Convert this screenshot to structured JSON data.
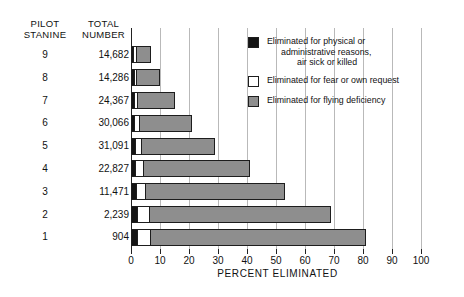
{
  "headers": {
    "stanine": "PILOT\nSTANINE",
    "number": "TOTAL\nNUMBER"
  },
  "axis": {
    "title": "PERCENT ELIMINATED",
    "ticks": [
      0,
      10,
      20,
      30,
      40,
      50,
      60,
      70,
      80,
      90,
      100
    ],
    "tick_labels": [
      "0",
      "10",
      "20",
      "30",
      "40",
      "50",
      "60",
      "70",
      "80",
      "90",
      "100"
    ],
    "min": 0,
    "max": 101
  },
  "legend": [
    {
      "swatch": "black",
      "label": "Eliminated for physical or\nadministrative reasons,\nair sick or killed"
    },
    {
      "swatch": "white",
      "label": "Eliminated for fear or own request"
    },
    {
      "swatch": "gray",
      "label": "Eliminated for flying deficiency"
    }
  ],
  "colors": {
    "black": "#141414",
    "white": "#ffffff",
    "gray": "#8e8e8e",
    "gridline": "#b9b9b9",
    "axis": "#222222"
  },
  "rows": [
    {
      "stanine": "9",
      "number": "14,682",
      "black": 0.6,
      "white": 0.5,
      "gray": 5.9,
      "total": 7.0
    },
    {
      "stanine": "8",
      "number": "14,286",
      "black": 0.7,
      "white": 0.6,
      "gray": 8.7,
      "total": 10.0
    },
    {
      "stanine": "7",
      "number": "24,367",
      "black": 0.8,
      "white": 0.9,
      "gray": 13.3,
      "total": 15.0
    },
    {
      "stanine": "6",
      "number": "30,066",
      "black": 0.9,
      "white": 1.3,
      "gray": 18.8,
      "total": 21.0
    },
    {
      "stanine": "5",
      "number": "31,091",
      "black": 1.0,
      "white": 1.8,
      "gray": 26.2,
      "total": 29.0
    },
    {
      "stanine": "4",
      "number": "22,827",
      "black": 1.2,
      "white": 2.3,
      "gray": 37.5,
      "total": 41.0
    },
    {
      "stanine": "3",
      "number": "11,471",
      "black": 1.3,
      "white": 2.9,
      "gray": 48.8,
      "total": 53.0
    },
    {
      "stanine": "2",
      "number": "2,239",
      "black": 1.6,
      "white": 4.2,
      "gray": 63.2,
      "total": 69.0
    },
    {
      "stanine": "1",
      "number": "904",
      "black": 1.7,
      "white": 4.4,
      "gray": 74.9,
      "total": 81.0
    }
  ],
  "chart_data": {
    "type": "bar",
    "title": "",
    "orientation": "horizontal",
    "stacked": true,
    "xlabel": "PERCENT ELIMINATED",
    "ylabel": "PILOT STANINE",
    "xlim": [
      0,
      101
    ],
    "grid": true,
    "legend_position": "top-right",
    "categories": [
      "9",
      "8",
      "7",
      "6",
      "5",
      "4",
      "3",
      "2",
      "1"
    ],
    "category_totals_label": "TOTAL NUMBER",
    "category_totals": [
      "14,682",
      "14,286",
      "24,367",
      "30,066",
      "31,091",
      "22,827",
      "11,471",
      "2,239",
      "904"
    ],
    "series": [
      {
        "name": "Eliminated for physical or administrative reasons, air sick or killed",
        "color": "#141414",
        "values": [
          0.6,
          0.7,
          0.8,
          0.9,
          1.0,
          1.2,
          1.3,
          1.6,
          1.7
        ]
      },
      {
        "name": "Eliminated for fear or own request",
        "color": "#ffffff",
        "values": [
          0.5,
          0.6,
          0.9,
          1.3,
          1.8,
          2.3,
          2.9,
          4.2,
          4.4
        ]
      },
      {
        "name": "Eliminated for flying deficiency",
        "color": "#8e8e8e",
        "values": [
          5.9,
          8.7,
          13.3,
          18.8,
          26.2,
          37.5,
          48.8,
          63.2,
          74.9
        ]
      }
    ],
    "totals": [
      7.0,
      10.0,
      15.0,
      21.0,
      29.0,
      41.0,
      53.0,
      69.0,
      81.0
    ],
    "xticks": [
      0,
      10,
      20,
      30,
      40,
      50,
      60,
      70,
      80,
      90,
      100
    ]
  }
}
